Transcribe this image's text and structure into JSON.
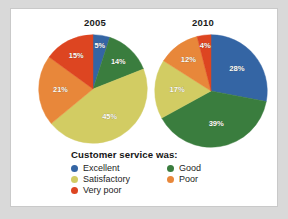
{
  "figure": {
    "background": "#ffffff",
    "page_background": "#d9d9d9"
  },
  "legend": {
    "title": "Customer service was:",
    "entries": [
      {
        "label": "Excellent",
        "color": "#3465a4",
        "name": "excellent"
      },
      {
        "label": "Good",
        "color": "#3a7d3e",
        "name": "good"
      },
      {
        "label": "Satisfactory",
        "color": "#d2cc63",
        "name": "satisfactory"
      },
      {
        "label": "Poor",
        "color": "#e8873a",
        "name": "poor"
      },
      {
        "label": "Very poor",
        "color": "#dd4521",
        "name": "very-poor"
      }
    ]
  },
  "chart_data": [
    {
      "type": "pie",
      "title": "2005",
      "categories": [
        "Excellent",
        "Good",
        "Satisfactory",
        "Poor",
        "Very poor"
      ],
      "values": [
        5,
        14,
        45,
        21,
        15
      ],
      "labels": [
        "5%",
        "14%",
        "45%",
        "21%",
        "15%"
      ],
      "colors": [
        "#3465a4",
        "#3a7d3e",
        "#d2cc63",
        "#e8873a",
        "#dd4521"
      ],
      "units": "percent",
      "start_angle_deg": 0,
      "direction": "clockwise",
      "legend_position": "bottom"
    },
    {
      "type": "pie",
      "title": "2010",
      "categories": [
        "Excellent",
        "Good",
        "Satisfactory",
        "Poor",
        "Very poor"
      ],
      "values": [
        28,
        39,
        17,
        12,
        4
      ],
      "labels": [
        "28%",
        "39%",
        "17%",
        "12%",
        "4%"
      ],
      "colors": [
        "#3465a4",
        "#3a7d3e",
        "#d2cc63",
        "#e8873a",
        "#dd4521"
      ],
      "units": "percent",
      "start_angle_deg": 0,
      "direction": "clockwise",
      "legend_position": "bottom"
    }
  ]
}
